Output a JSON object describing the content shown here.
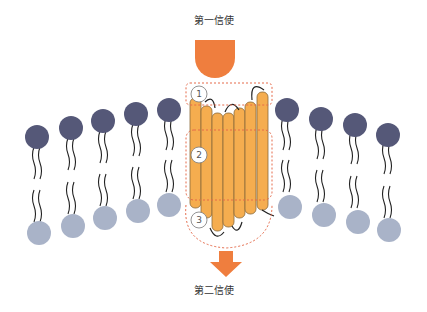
{
  "labels": {
    "first_messenger": "第一信使",
    "second_messenger": "第二信使"
  },
  "regions": [
    {
      "number": "1",
      "description": "extracellular ligand binding region"
    },
    {
      "number": "2",
      "description": "transmembrane helix region"
    },
    {
      "number": "3",
      "description": "intracellular loop region"
    }
  ],
  "colors": {
    "messenger": "#ef7e3e",
    "helix": "#f5ad4f",
    "helix_stroke": "#8a6a3a",
    "head_outer": "#555878",
    "head_inner": "#a9b3c8",
    "dashed": "#e56a4a"
  },
  "icons": {
    "ligand": "orange-rounded-shape",
    "arrow": "down-arrow"
  }
}
